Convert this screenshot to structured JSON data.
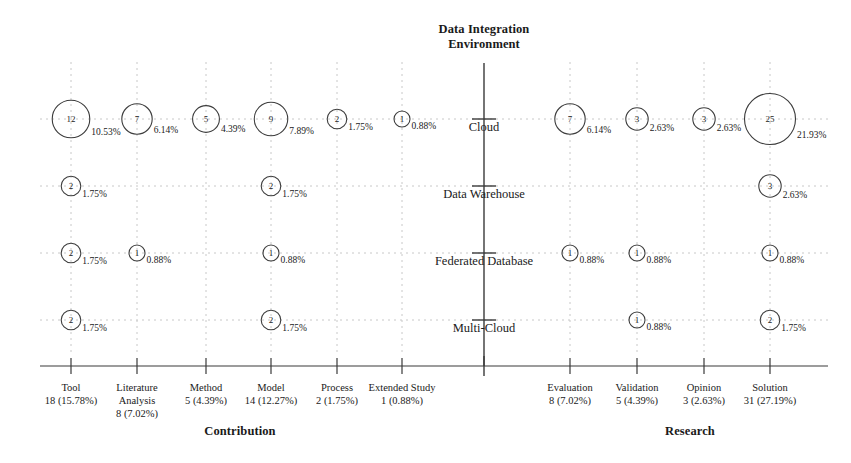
{
  "titles": {
    "top": "Data Integration\nEnvironment",
    "top_line1": "Data Integration",
    "top_line2": "Environment",
    "left_axis": "Contribution",
    "right_axis": "Research"
  },
  "colors": {
    "bubble_stroke": "#3c3c3c",
    "grid": "#c8c8c8",
    "axis": "#3a3a3a",
    "text": "#1a1a1a"
  },
  "chart_data": {
    "type": "scatter",
    "title": "Data Integration Environment",
    "xlabel": "Contribution / Research",
    "ylabel": "Data Integration Environment",
    "grid": true,
    "legend": "none",
    "note": "Bubble matrix: circle area encodes count; label beside circle is percentage of total (114 papers).",
    "groups": [
      {
        "name": "Contribution",
        "categories": [
          "Tool",
          "Literature Analysis",
          "Method",
          "Model",
          "Process",
          "Extended Study"
        ]
      },
      {
        "name": "Research",
        "categories": [
          "Evaluation",
          "Validation",
          "Opinion",
          "Solution"
        ]
      }
    ],
    "x_categories": [
      {
        "label": "Tool",
        "total": 18,
        "total_pct": "15.78%",
        "stat": "18 (15.78%)"
      },
      {
        "label": "Literature Analysis",
        "label_line1": "Literature",
        "label_line2": "Analysis",
        "total": 8,
        "total_pct": "7.02%",
        "stat": "8 (7.02%)"
      },
      {
        "label": "Method",
        "total": 5,
        "total_pct": "4.39%",
        "stat": "5 (4.39%)"
      },
      {
        "label": "Model",
        "total": 14,
        "total_pct": "12.27%",
        "stat": "14 (12.27%)"
      },
      {
        "label": "Process",
        "total": 2,
        "total_pct": "1.75%",
        "stat": "2 (1.75%)"
      },
      {
        "label": "Extended Study",
        "total": 1,
        "total_pct": "0.88%",
        "stat": "1 (0.88%)"
      },
      {
        "label": "Evaluation",
        "total": 8,
        "total_pct": "7.02%",
        "stat": "8 (7.02%)"
      },
      {
        "label": "Validation",
        "total": 5,
        "total_pct": "4.39%",
        "stat": "5 (4.39%)"
      },
      {
        "label": "Opinion",
        "total": 3,
        "total_pct": "2.63%",
        "stat": "3 (2.63%)"
      },
      {
        "label": "Solution",
        "total": 31,
        "total_pct": "27.19%",
        "stat": "31 (27.19%)"
      }
    ],
    "y_categories": [
      "Cloud",
      "Data Warehouse",
      "Federated Database",
      "Multi-Cloud"
    ],
    "points": [
      {
        "row": "Cloud",
        "col": "Tool",
        "value": 12,
        "pct": "10.53%"
      },
      {
        "row": "Cloud",
        "col": "Literature Analysis",
        "value": 7,
        "pct": "6.14%"
      },
      {
        "row": "Cloud",
        "col": "Method",
        "value": 5,
        "pct": "4.39%"
      },
      {
        "row": "Cloud",
        "col": "Model",
        "value": 9,
        "pct": "7.89%"
      },
      {
        "row": "Cloud",
        "col": "Process",
        "value": 2,
        "pct": "1.75%"
      },
      {
        "row": "Cloud",
        "col": "Extended Study",
        "value": 1,
        "pct": "0.88%"
      },
      {
        "row": "Cloud",
        "col": "Evaluation",
        "value": 7,
        "pct": "6.14%"
      },
      {
        "row": "Cloud",
        "col": "Validation",
        "value": 3,
        "pct": "2.63%"
      },
      {
        "row": "Cloud",
        "col": "Opinion",
        "value": 3,
        "pct": "2.63%"
      },
      {
        "row": "Cloud",
        "col": "Solution",
        "value": 25,
        "pct": "21.93%"
      },
      {
        "row": "Data Warehouse",
        "col": "Tool",
        "value": 2,
        "pct": "1.75%"
      },
      {
        "row": "Data Warehouse",
        "col": "Model",
        "value": 2,
        "pct": "1.75%"
      },
      {
        "row": "Data Warehouse",
        "col": "Solution",
        "value": 3,
        "pct": "2.63%"
      },
      {
        "row": "Federated Database",
        "col": "Tool",
        "value": 2,
        "pct": "1.75%"
      },
      {
        "row": "Federated Database",
        "col": "Literature Analysis",
        "value": 1,
        "pct": "0.88%"
      },
      {
        "row": "Federated Database",
        "col": "Model",
        "value": 1,
        "pct": "0.88%"
      },
      {
        "row": "Federated Database",
        "col": "Evaluation",
        "value": 1,
        "pct": "0.88%"
      },
      {
        "row": "Federated Database",
        "col": "Validation",
        "value": 1,
        "pct": "0.88%"
      },
      {
        "row": "Federated Database",
        "col": "Solution",
        "value": 1,
        "pct": "0.88%"
      },
      {
        "row": "Multi-Cloud",
        "col": "Tool",
        "value": 2,
        "pct": "1.75%"
      },
      {
        "row": "Multi-Cloud",
        "col": "Model",
        "value": 2,
        "pct": "1.75%"
      },
      {
        "row": "Multi-Cloud",
        "col": "Validation",
        "value": 1,
        "pct": "0.88%"
      },
      {
        "row": "Multi-Cloud",
        "col": "Solution",
        "value": 2,
        "pct": "1.75%"
      }
    ]
  },
  "layout": {
    "col_x": {
      "Tool": 71,
      "Literature Analysis": 137,
      "Method": 206,
      "Model": 271,
      "Process": 337,
      "Extended Study": 402,
      "Evaluation": 570,
      "Validation": 637,
      "Opinion": 704,
      "Solution": 770
    },
    "row_y": {
      "Cloud": 119,
      "Data Warehouse": 186,
      "Federated Database": 253,
      "Multi-Cloud": 320
    },
    "center_axis_x": 484,
    "grid_top": 62,
    "grid_bottom": 355,
    "x_axis_y": 366,
    "x_axis_left": 40,
    "x_axis_right": 828
  }
}
